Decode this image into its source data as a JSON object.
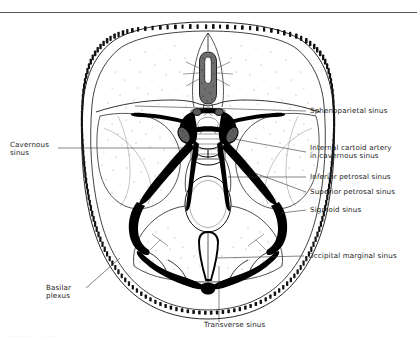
{
  "figure": {
    "view": "Superior view of the interior of the skull base showing the dural venous sinuses",
    "ink_color": "#000000",
    "background_color": "#ffffff",
    "line_color": "#333333"
  },
  "labels": {
    "sphenoparietal": "Sphenoparietal sinus",
    "cavernous": "Cavernous\nsinus",
    "internal_carotid": "Internal cartoid artery\nin cavernous sinus",
    "inferior_petrosal": "Inferior petrosal sinus",
    "superior_petrosal": "Superior petrosal sinus",
    "sigmoid": "Sigmoid sinus",
    "occipital_marginal": "Occipital marginal sinus",
    "basilar_plexus": "Basilar\nplexus",
    "transverse": "Transverse sinus"
  },
  "structures": {
    "skull_rim": "cranial-vault-bone-with-diploe",
    "crista_galli": "crista-galli",
    "sella_turcica": "sella-turcica",
    "foramen_magnum": "foramen-magnum",
    "anterior_fossa": "anterior-cranial-fossa",
    "middle_fossa": "middle-cranial-fossa",
    "posterior_fossa": "posterior-cranial-fossa",
    "petrous_ridge": "petrous-temporal-ridge"
  },
  "caption_partial": "· ·  ·   ·  ·    ·   ·   ·   ·    ·  ·"
}
